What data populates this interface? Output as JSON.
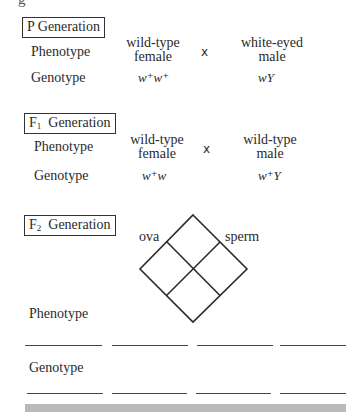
{
  "top_fragment": "g",
  "p_generation": {
    "title": "P Generation",
    "phenotype_label": "Phenotype",
    "genotype_label": "Genotype",
    "female": {
      "phenotype_line1": "wild-type",
      "phenotype_line2": "female",
      "genotype": "w⁺w⁺"
    },
    "cross_symbol": "x",
    "male": {
      "phenotype_line1": "white-eyed",
      "phenotype_line2": "male",
      "genotype": "wY"
    }
  },
  "f1_generation": {
    "title_prefix": "F",
    "title_sub": "1",
    "title_suffix": "Generation",
    "phenotype_label": "Phenotype",
    "genotype_label": "Genotype",
    "female": {
      "phenotype_line1": "wild-type",
      "phenotype_line2": "female",
      "genotype": "w⁺w"
    },
    "cross_symbol": "x",
    "male": {
      "phenotype_line1": "wild-type",
      "phenotype_line2": "male",
      "genotype": "w⁺Y"
    }
  },
  "f2_generation": {
    "title_prefix": "F",
    "title_sub": "2",
    "title_suffix": "Generation",
    "punnett": {
      "ova_label": "ova",
      "sperm_label": "sperm",
      "cells": 4
    },
    "phenotype_label": "Phenotype",
    "genotype_label": "Genotype",
    "phenotype_blanks": [
      "",
      "",
      "",
      ""
    ],
    "genotype_blanks": [
      "",
      "",
      "",
      ""
    ]
  }
}
